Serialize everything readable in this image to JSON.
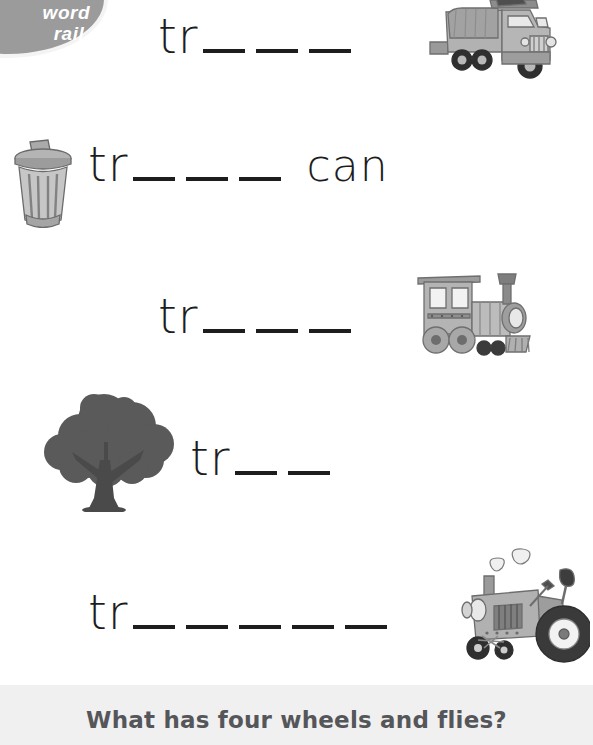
{
  "badge": {
    "line1": "word",
    "line2": "rail.",
    "color": "#9b9b9b"
  },
  "worksheet": {
    "prefix": "tr",
    "rows": [
      {
        "id": "truck",
        "prefix": "tr",
        "blanks": 3,
        "tail": "",
        "picture": "garbage-truck-image",
        "picture_side": "right"
      },
      {
        "id": "trash",
        "prefix": "tr",
        "blanks": 3,
        "tail": "can",
        "picture": "trash-can-image",
        "picture_side": "left"
      },
      {
        "id": "train",
        "prefix": "tr",
        "blanks": 3,
        "tail": "",
        "picture": "train-locomotive-image",
        "picture_side": "right"
      },
      {
        "id": "tree",
        "prefix": "tr",
        "blanks": 2,
        "tail": "",
        "picture": "tree-image",
        "picture_side": "left"
      },
      {
        "id": "tractor",
        "prefix": "tr",
        "blanks": 5,
        "tail": "",
        "picture": "tractor-image",
        "picture_side": "right"
      }
    ]
  },
  "riddle": {
    "text": "What has four wheels and flies?",
    "background": "#f0f0f0",
    "text_color": "#55565a"
  }
}
